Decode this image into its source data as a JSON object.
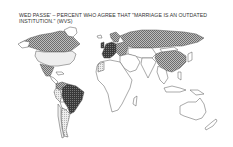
{
  "title": {
    "line1": "WED PASSE' – PERCENT WHO AGREE THAT \"MARRIAGE IS AN OUTDATED",
    "line2": "INSTITUTION.\" (WVS)"
  },
  "map": {
    "type": "choropleth-world",
    "legend": null,
    "shading_levels": {
      "none": "#ffffff",
      "light": "#e6e6e6",
      "light_hatch": "#cfcfcf",
      "medium_hatch": "#a0a0a0",
      "dark": "#555555"
    },
    "regions": [
      {
        "name": "Canada",
        "shade": "medium_hatch"
      },
      {
        "name": "United States",
        "shade": "light"
      },
      {
        "name": "Mexico",
        "shade": "medium_hatch"
      },
      {
        "name": "Greenland",
        "shade": "none"
      },
      {
        "name": "Brazil",
        "shade": "dark"
      },
      {
        "name": "Argentina",
        "shade": "light_hatch"
      },
      {
        "name": "Chile",
        "shade": "light"
      },
      {
        "name": "Peru",
        "shade": "light_hatch"
      },
      {
        "name": "Venezuela",
        "shade": "medium_hatch"
      },
      {
        "name": "Western Europe",
        "shade": "dark"
      },
      {
        "name": "Eastern Europe",
        "shade": "medium_hatch"
      },
      {
        "name": "Russia",
        "shade": "medium_hatch"
      },
      {
        "name": "China",
        "shade": "medium_hatch"
      },
      {
        "name": "Africa",
        "shade": "none"
      },
      {
        "name": "Middle East",
        "shade": "none"
      },
      {
        "name": "India",
        "shade": "none"
      },
      {
        "name": "Southeast Asia",
        "shade": "none"
      },
      {
        "name": "Australia",
        "shade": "none"
      },
      {
        "name": "New Zealand",
        "shade": "none"
      },
      {
        "name": "Japan",
        "shade": "none"
      }
    ]
  }
}
